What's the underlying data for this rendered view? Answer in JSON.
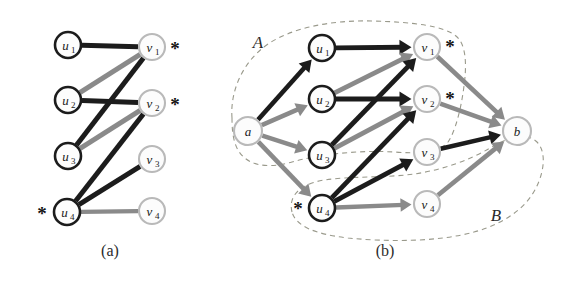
{
  "figure": {
    "width": 565,
    "height": 286,
    "background": "#ffffff",
    "colors": {
      "edge_black": "#1c1c1c",
      "edge_gray": "#8a8a8a",
      "node_dark_stroke": "#1c1c1c",
      "node_light_stroke": "#b9b9b9",
      "node_fill": "#fdfdfd",
      "region_dash": "#9a9a8c",
      "text": "#1a1a1a"
    }
  },
  "panels": [
    {
      "id": "panel-a",
      "caption": "(a)",
      "caption_pos": {
        "x": 110,
        "y": 250
      },
      "nodes": [
        {
          "id": "u1",
          "label": "u",
          "sub": "1",
          "x": 68,
          "y": 45,
          "r": 13,
          "style": "dark"
        },
        {
          "id": "u2",
          "label": "u",
          "sub": "2",
          "x": 68,
          "y": 100,
          "r": 13,
          "style": "dark"
        },
        {
          "id": "u3",
          "label": "u",
          "sub": "3",
          "x": 68,
          "y": 156,
          "r": 13,
          "style": "dark"
        },
        {
          "id": "u4",
          "label": "u",
          "sub": "4",
          "x": 67,
          "y": 212,
          "r": 13,
          "style": "dark"
        },
        {
          "id": "v1",
          "label": "v",
          "sub": "1",
          "x": 152,
          "y": 47,
          "r": 13,
          "style": "light"
        },
        {
          "id": "v2",
          "label": "v",
          "sub": "2",
          "x": 152,
          "y": 103,
          "r": 13,
          "style": "light"
        },
        {
          "id": "v3",
          "label": "v",
          "sub": "3",
          "x": 152,
          "y": 159,
          "r": 13,
          "style": "light"
        },
        {
          "id": "v4",
          "label": "v",
          "sub": "4",
          "x": 152,
          "y": 211,
          "r": 13,
          "style": "light"
        }
      ],
      "edges": [
        {
          "from": "u1",
          "to": "v1",
          "color": "black",
          "width": 5.0,
          "arrow": false
        },
        {
          "from": "u2",
          "to": "v1",
          "color": "gray",
          "width": 5.0,
          "arrow": false
        },
        {
          "from": "u3",
          "to": "v1",
          "color": "black",
          "width": 5.0,
          "arrow": false
        },
        {
          "from": "u2",
          "to": "v2",
          "color": "black",
          "width": 5.0,
          "arrow": false
        },
        {
          "from": "u3",
          "to": "v2",
          "color": "gray",
          "width": 5.0,
          "arrow": false
        },
        {
          "from": "u4",
          "to": "v2",
          "color": "black",
          "width": 5.0,
          "arrow": false
        },
        {
          "from": "u4",
          "to": "v3",
          "color": "black",
          "width": 5.0,
          "arrow": false
        },
        {
          "from": "u4",
          "to": "v4",
          "color": "gray",
          "width": 4.4,
          "arrow": false
        }
      ],
      "asterisks": [
        {
          "id": "ast-v1",
          "text": "*",
          "x": 175,
          "y": 48
        },
        {
          "id": "ast-v2",
          "text": "*",
          "x": 175,
          "y": 104
        },
        {
          "id": "ast-u4",
          "text": "*",
          "x": 42,
          "y": 213
        }
      ],
      "regions": []
    },
    {
      "id": "panel-b",
      "caption": "(b)",
      "caption_pos": {
        "x": 385,
        "y": 250
      },
      "nodes": [
        {
          "id": "a",
          "label": "a",
          "sub": "",
          "x": 248,
          "y": 131,
          "r": 14,
          "style": "light"
        },
        {
          "id": "u1",
          "label": "u",
          "sub": "1",
          "x": 322,
          "y": 48,
          "r": 13,
          "style": "dark"
        },
        {
          "id": "u2",
          "label": "u",
          "sub": "2",
          "x": 322,
          "y": 99,
          "r": 13,
          "style": "dark"
        },
        {
          "id": "u3",
          "label": "u",
          "sub": "3",
          "x": 322,
          "y": 155,
          "r": 13,
          "style": "dark"
        },
        {
          "id": "u4",
          "label": "u",
          "sub": "4",
          "x": 322,
          "y": 208,
          "r": 13,
          "style": "dark"
        },
        {
          "id": "v1",
          "label": "v",
          "sub": "1",
          "x": 427,
          "y": 47,
          "r": 13,
          "style": "light"
        },
        {
          "id": "v2",
          "label": "v",
          "sub": "2",
          "x": 427,
          "y": 99,
          "r": 13,
          "style": "light"
        },
        {
          "id": "v3",
          "label": "v",
          "sub": "3",
          "x": 427,
          "y": 152,
          "r": 13,
          "style": "light"
        },
        {
          "id": "v4",
          "label": "v",
          "sub": "4",
          "x": 427,
          "y": 204,
          "r": 13,
          "style": "light"
        },
        {
          "id": "b",
          "label": "b",
          "sub": "",
          "x": 517,
          "y": 131,
          "r": 14,
          "style": "light"
        }
      ],
      "edges": [
        {
          "from": "a",
          "to": "u1",
          "color": "black",
          "width": 4.6,
          "arrow": true
        },
        {
          "from": "a",
          "to": "u2",
          "color": "gray",
          "width": 4.6,
          "arrow": true
        },
        {
          "from": "a",
          "to": "u3",
          "color": "gray",
          "width": 4.6,
          "arrow": true
        },
        {
          "from": "a",
          "to": "u4",
          "color": "gray",
          "width": 4.6,
          "arrow": true
        },
        {
          "from": "u1",
          "to": "v1",
          "color": "black",
          "width": 4.8,
          "arrow": true
        },
        {
          "from": "u2",
          "to": "v1",
          "color": "gray",
          "width": 4.8,
          "arrow": true
        },
        {
          "from": "u3",
          "to": "v1",
          "color": "black",
          "width": 4.8,
          "arrow": true
        },
        {
          "from": "u2",
          "to": "v2",
          "color": "black",
          "width": 4.8,
          "arrow": true
        },
        {
          "from": "u3",
          "to": "v2",
          "color": "gray",
          "width": 4.8,
          "arrow": true
        },
        {
          "from": "u4",
          "to": "v2",
          "color": "black",
          "width": 4.8,
          "arrow": true
        },
        {
          "from": "u4",
          "to": "v3",
          "color": "black",
          "width": 4.8,
          "arrow": true
        },
        {
          "from": "u4",
          "to": "v4",
          "color": "gray",
          "width": 4.4,
          "arrow": true
        },
        {
          "from": "v1",
          "to": "b",
          "color": "gray",
          "width": 4.6,
          "arrow": true
        },
        {
          "from": "v2",
          "to": "b",
          "color": "gray",
          "width": 4.6,
          "arrow": true
        },
        {
          "from": "v3",
          "to": "b",
          "color": "black",
          "width": 4.6,
          "arrow": true
        },
        {
          "from": "v4",
          "to": "b",
          "color": "gray",
          "width": 4.6,
          "arrow": true
        }
      ],
      "asterisks": [
        {
          "id": "ast-v1",
          "text": "*",
          "x": 450,
          "y": 46
        },
        {
          "id": "ast-v2",
          "text": "*",
          "x": 450,
          "y": 98
        },
        {
          "id": "ast-u4",
          "text": "*",
          "x": 298,
          "y": 208
        }
      ],
      "regions": [
        {
          "id": "region-a",
          "label": "A",
          "label_pos": {
            "x": 258,
            "y": 42
          },
          "path": "M 232 118 C 230 92 242 62 268 44 C 292 28 330 20 372 21 C 414 22 444 26 456 36 C 466 44 467 64 464 86 C 461 110 455 132 448 142 C 440 152 420 154 394 152 C 360 150 320 154 292 162 C 264 170 246 164 238 150 C 233 141 232 130 232 118 Z"
        },
        {
          "id": "region-b",
          "label": "B",
          "label_pos": {
            "x": 496,
            "y": 215
          },
          "path": "M 292 212 C 288 196 300 184 324 180 C 352 176 386 178 414 174 C 442 170 470 160 490 148 C 508 137 527 132 537 142 C 546 151 545 170 536 188 C 526 208 504 224 474 232 C 438 242 388 242 348 238 C 314 234 296 226 292 212 Z"
        }
      ]
    }
  ]
}
